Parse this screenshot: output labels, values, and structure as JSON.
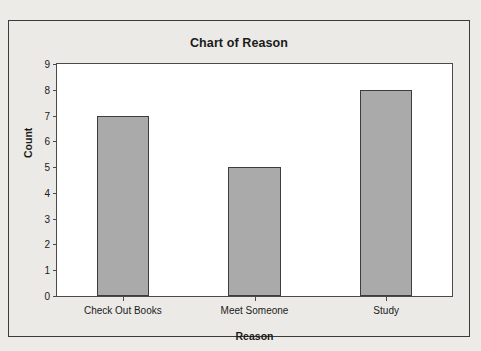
{
  "chart_data": {
    "type": "bar",
    "title": "Chart of Reason",
    "xlabel": "Reason",
    "ylabel": "Count",
    "categories": [
      "Check Out Books",
      "Meet Someone",
      "Study"
    ],
    "values": [
      7,
      5,
      8
    ],
    "ylim": [
      0,
      9
    ],
    "ytick_labels": [
      "0",
      "1",
      "2",
      "3",
      "4",
      "5",
      "6",
      "7",
      "8",
      "9"
    ],
    "ytick_values": [
      0,
      1,
      2,
      3,
      4,
      5,
      6,
      7,
      8,
      9
    ],
    "grid": false,
    "legend": null,
    "series": [
      {
        "name": "Count",
        "values": [
          7,
          5,
          8
        ]
      }
    ],
    "colors": {
      "bar_fill": "#aaaaaa",
      "bar_border": "#3d3d3d",
      "plot_background": "#ffffff",
      "figure_background": "#eceae7",
      "frame_border": "#3b3b3b",
      "text": "#1a1a1a"
    }
  }
}
